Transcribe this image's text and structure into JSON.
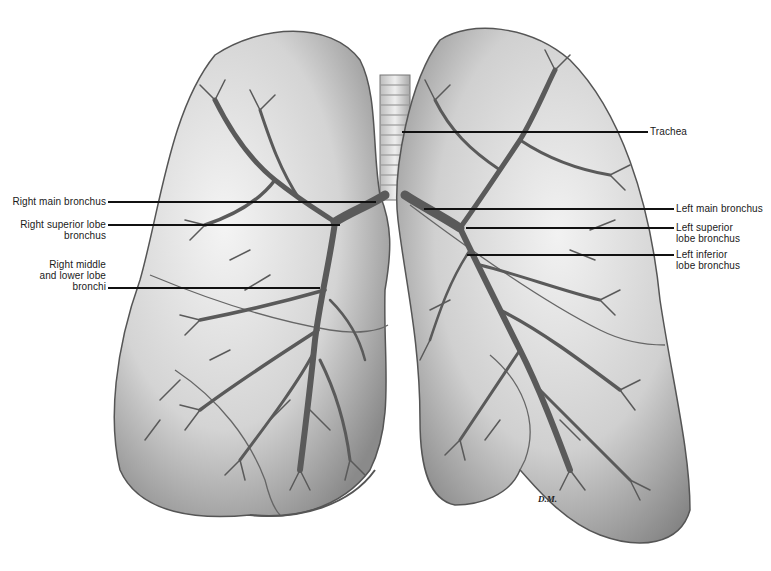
{
  "diagram": {
    "labels": {
      "trachea": "Trachea",
      "right_main_bronchus": "Right main bronchus",
      "right_superior_lobe_bronchus_1": "Right superior lobe",
      "right_superior_lobe_bronchus_2": "bronchus",
      "right_middle_lower_1": "Right middle",
      "right_middle_lower_2": "and lower lobe",
      "right_middle_lower_3": "bronchi",
      "left_main_bronchus": "Left main bronchus",
      "left_superior_lobe_bronchus_1": "Left superior",
      "left_superior_lobe_bronchus_2": "lobe bronchus",
      "left_inferior_lobe_bronchus_1": "Left inferior",
      "left_inferior_lobe_bronchus_2": "lobe bronchus"
    },
    "signature": "D.M."
  }
}
